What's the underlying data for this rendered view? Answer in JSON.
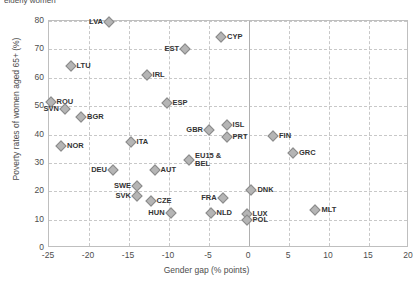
{
  "caption_fragment": "elderly women",
  "chart_data": {
    "type": "scatter",
    "title": "",
    "xlabel": "Gender gap (% points)",
    "ylabel": "Poverty rates of women aged 65+ (%)",
    "xlim": [
      -25,
      20
    ],
    "ylim": [
      0,
      80
    ],
    "xticks": [
      -25,
      -20,
      -15,
      -10,
      -5,
      0,
      5,
      10,
      15,
      20
    ],
    "yticks": [
      0,
      10,
      20,
      30,
      40,
      50,
      60,
      70,
      80
    ],
    "grid": true,
    "legend": "none",
    "marker": "diamond",
    "marker_color": "#b5b5b5",
    "marker_edge_color": "#8a8a8a",
    "points": [
      {
        "label": "LVA",
        "x": -17.5,
        "y": 79.5,
        "pos": "left"
      },
      {
        "label": "CYP",
        "x": -3.5,
        "y": 74.5,
        "pos": "right"
      },
      {
        "label": "EST",
        "x": -8.0,
        "y": 70.0,
        "pos": "left"
      },
      {
        "label": "LTU",
        "x": -22.3,
        "y": 64.0,
        "pos": "right"
      },
      {
        "label": "IRL",
        "x": -12.8,
        "y": 61.0,
        "pos": "right"
      },
      {
        "label": "ROU",
        "x": -24.8,
        "y": 51.5,
        "pos": "right"
      },
      {
        "label": "ESP",
        "x": -10.3,
        "y": 51.0,
        "pos": "right"
      },
      {
        "label": "SVN",
        "x": -23.0,
        "y": 49.0,
        "pos": "left"
      },
      {
        "label": "BGR",
        "x": -21.0,
        "y": 46.0,
        "pos": "right"
      },
      {
        "label": "ISL",
        "x": -2.8,
        "y": 43.5,
        "pos": "right"
      },
      {
        "label": "GBR",
        "x": -5.0,
        "y": 41.5,
        "pos": "left"
      },
      {
        "label": "PRT",
        "x": -2.8,
        "y": 39.0,
        "pos": "right"
      },
      {
        "label": "FIN",
        "x": 3.0,
        "y": 39.5,
        "pos": "right"
      },
      {
        "label": "NOR",
        "x": -23.5,
        "y": 36.0,
        "pos": "right"
      },
      {
        "label": "ITA",
        "x": -14.8,
        "y": 37.5,
        "pos": "right"
      },
      {
        "label": "GRC",
        "x": 5.5,
        "y": 33.5,
        "pos": "right"
      },
      {
        "label": "EU15 & BEL",
        "x": -7.5,
        "y": 31.0,
        "pos": "right2"
      },
      {
        "label": "DEU",
        "x": -17.0,
        "y": 27.5,
        "pos": "left"
      },
      {
        "label": "AUT",
        "x": -11.8,
        "y": 27.5,
        "pos": "right"
      },
      {
        "label": "SWE",
        "x": -14.0,
        "y": 22.0,
        "pos": "left"
      },
      {
        "label": "DNK",
        "x": 0.3,
        "y": 20.5,
        "pos": "right"
      },
      {
        "label": "SVK",
        "x": -14.0,
        "y": 18.5,
        "pos": "left"
      },
      {
        "label": "FRA",
        "x": -3.3,
        "y": 17.5,
        "pos": "left"
      },
      {
        "label": "CZE",
        "x": -12.3,
        "y": 16.5,
        "pos": "right"
      },
      {
        "label": "MLT",
        "x": 8.3,
        "y": 13.5,
        "pos": "right"
      },
      {
        "label": "HUN",
        "x": -9.8,
        "y": 12.5,
        "pos": "left"
      },
      {
        "label": "NLD",
        "x": -4.8,
        "y": 12.5,
        "pos": "right"
      },
      {
        "label": "LUX",
        "x": -0.3,
        "y": 12.0,
        "pos": "right"
      },
      {
        "label": "POL",
        "x": -0.3,
        "y": 10.0,
        "pos": "right"
      }
    ]
  }
}
